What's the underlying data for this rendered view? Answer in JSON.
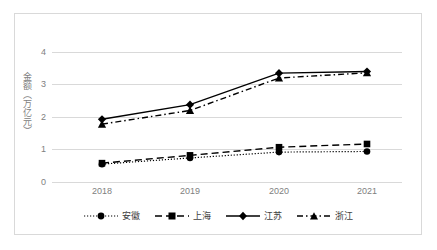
{
  "chart_data": {
    "type": "line",
    "title": "",
    "xlabel": "",
    "ylabel": "金额（万亿元）",
    "categories": [
      "2018",
      "2019",
      "2020",
      "2021"
    ],
    "ylim": [
      0,
      4
    ],
    "yticks": [
      0,
      1,
      2,
      3,
      4
    ],
    "grid": true,
    "legend_position": "bottom",
    "series": [
      {
        "name": "安徽",
        "values": [
          0.55,
          0.74,
          0.92,
          0.94
        ],
        "marker": "circle",
        "line_style": "dotted",
        "color": "#000000"
      },
      {
        "name": "上海",
        "values": [
          0.58,
          0.82,
          1.07,
          1.17
        ],
        "marker": "square",
        "line_style": "dashed",
        "color": "#000000"
      },
      {
        "name": "江苏",
        "values": [
          1.93,
          2.38,
          3.35,
          3.4
        ],
        "marker": "diamond",
        "line_style": "solid",
        "color": "#000000"
      },
      {
        "name": "浙江",
        "values": [
          1.78,
          2.2,
          3.2,
          3.36
        ],
        "marker": "triangle",
        "line_style": "dashdot",
        "color": "#000000"
      }
    ]
  },
  "axis": {
    "y_labels": [
      "4",
      "3",
      "2",
      "1",
      "0"
    ],
    "y_title": "金额（万亿元）",
    "x_labels": [
      "2018",
      "2019",
      "2020",
      "2021"
    ]
  },
  "legend": {
    "items": [
      {
        "label": "安徽"
      },
      {
        "label": "上海"
      },
      {
        "label": "江苏"
      },
      {
        "label": "浙江"
      }
    ]
  },
  "colors": {
    "line": "#000000",
    "grid": "#d9d9d9",
    "border": "#d9d9d9",
    "tick_text": "#808080",
    "legend_text": "#404040",
    "background": "#ffffff"
  }
}
